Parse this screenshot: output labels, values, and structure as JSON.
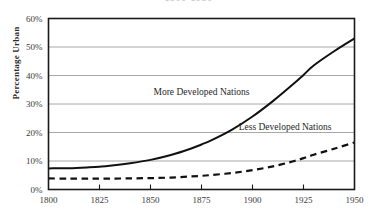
{
  "chart_data": {
    "type": "line",
    "title": "1800-1950",
    "xlabel": "",
    "ylabel": "Percentage Urban",
    "xlim": [
      1800,
      1950
    ],
    "ylim": [
      0,
      60
    ],
    "grid": true,
    "grid_axis": "y",
    "legend_position": "inline-annotation",
    "x_ticks": [
      "1800",
      "1825",
      "1850",
      "1875",
      "1900",
      "1925",
      "1950"
    ],
    "x_tick_values": [
      1800,
      1825,
      1850,
      1875,
      1900,
      1925,
      1950
    ],
    "y_ticks": [
      "0%",
      "10%",
      "20%",
      "30%",
      "40%",
      "50%",
      "60%"
    ],
    "y_tick_values": [
      0,
      10,
      20,
      30,
      40,
      50,
      60
    ],
    "x": [
      1800,
      1810,
      1820,
      1825,
      1830,
      1840,
      1850,
      1860,
      1870,
      1875,
      1880,
      1890,
      1900,
      1910,
      1920,
      1925,
      1930,
      1940,
      1950
    ],
    "series": [
      {
        "name": "More Developed Nations",
        "style": "solid",
        "color": "#111111",
        "values": [
          7.4,
          7.5,
          7.8,
          8.0,
          8.3,
          9.2,
          10.4,
          12.1,
          14.4,
          15.8,
          17.3,
          21.0,
          25.6,
          31.0,
          37.0,
          40.2,
          43.5,
          48.5,
          53.0
        ]
      },
      {
        "name": "Less Developed Nations",
        "style": "dashed",
        "color": "#111111",
        "values": [
          3.9,
          3.8,
          3.8,
          3.8,
          3.8,
          3.9,
          4.0,
          4.2,
          4.6,
          4.8,
          5.1,
          5.8,
          6.8,
          8.1,
          9.9,
          11.0,
          12.2,
          14.3,
          16.5
        ]
      }
    ],
    "annotations": [
      {
        "text": "More Developed Nations",
        "x": 1875,
        "y": 33
      },
      {
        "text": "Less Developed Nations",
        "x": 1916,
        "y": 21
      }
    ],
    "colors": {
      "axis": "#1a1a1a",
      "gridline": "#a8a8a8",
      "line": "#111111",
      "text": "#2b2b2b",
      "background": "#ffffff"
    }
  }
}
